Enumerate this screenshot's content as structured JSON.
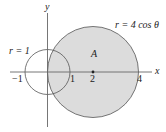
{
  "diagram": {
    "type": "polar-curves",
    "axes": {
      "x_label": "x",
      "y_label": "y"
    },
    "curves": [
      {
        "id": "unit-circle",
        "equation_label": "r = 1",
        "center": [
          0,
          0
        ],
        "radius": 1
      },
      {
        "id": "big-circle",
        "equation_label": "r = 4 cos θ",
        "center": [
          2,
          0
        ],
        "radius": 2,
        "fill": "#dcdcdc"
      }
    ],
    "region_label": "A",
    "tick_labels": [
      "−1",
      "1",
      "2",
      "4"
    ],
    "center_point": "2"
  },
  "labels": {
    "y_axis": "y",
    "x_axis": "x",
    "r1": "r = 1",
    "r4": "r = 4 cos θ",
    "region": "A",
    "tick_neg1": "−1",
    "tick_1": "1",
    "tick_2": "2",
    "tick_4": "4"
  },
  "colors": {
    "fill": "#dcdcdc",
    "stroke": "#555555",
    "axis": "#666666"
  }
}
